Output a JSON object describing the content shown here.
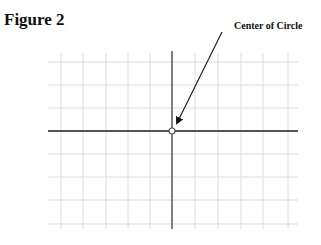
{
  "figure": {
    "title": "Figure 2",
    "callout_label": "Center of Circle"
  },
  "grid": {
    "vertical_lines_x": [
      61,
      83,
      106,
      128,
      150,
      195,
      218,
      241,
      263,
      288
    ],
    "horizontal_lines_y": [
      62,
      85,
      108,
      154,
      177,
      200,
      224
    ],
    "x_extent": [
      48,
      298
    ],
    "y_extent": [
      51,
      229
    ],
    "grid_color": "#dcdcdc",
    "axis_color": "#555555"
  },
  "axes": {
    "origin": [
      172,
      131
    ]
  },
  "center_point": {
    "cx": 172,
    "cy": 131,
    "r": 3
  },
  "arrow": {
    "from": [
      222,
      32
    ],
    "to": [
      177,
      123
    ]
  }
}
